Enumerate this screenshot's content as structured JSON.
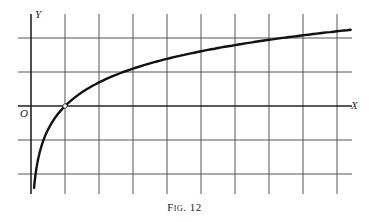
{
  "figure": {
    "caption": "Fig. 12",
    "y_axis_label": "Y",
    "x_axis_label": "X",
    "origin_label": "O"
  },
  "chart_data": {
    "type": "line",
    "title": "Fig. 12",
    "xlabel": "X",
    "ylabel": "Y",
    "function": "y = ln(x)",
    "xlim": [
      -0.9,
      9.6
    ],
    "ylim": [
      -2.6,
      2.3
    ],
    "grid": true,
    "grid_spacing": 1,
    "series": [
      {
        "name": "y = ln x",
        "x": [
          0.09,
          0.15,
          0.25,
          0.4,
          0.6,
          1,
          1.5,
          2,
          3,
          4,
          5,
          6,
          7,
          8,
          9,
          9.4
        ],
        "y": [
          -2.41,
          -1.9,
          -1.39,
          -0.92,
          -0.51,
          0,
          0.41,
          0.69,
          1.1,
          1.39,
          1.61,
          1.79,
          1.95,
          2.08,
          2.2,
          2.24
        ]
      }
    ],
    "marked_points": [
      {
        "x": 1,
        "y": 0,
        "style": "open-circle"
      }
    ]
  }
}
